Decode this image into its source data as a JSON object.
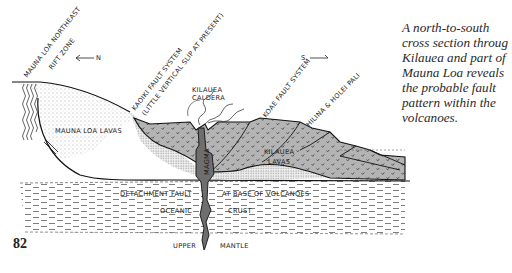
{
  "figure": {
    "labels": {
      "mauna_loa_rift_line1": "MAUNA LOA NORTHEAST",
      "mauna_loa_rift_line2": "RIFT ZONE",
      "north_arrow": "N",
      "south_arrow": "S",
      "kaoiki_line1": "KAOIKI FAULT SYSTEM",
      "kaoiki_line2": "(LITTLE VERTICAL SLIP AT PRESENT)",
      "caldera_line1": "KILAUEA",
      "caldera_line2": "CALDERA",
      "koae": "KOAE FAULT SYSTEM",
      "hilina": "HILINA & HOLEI PALI",
      "mauna_loa_lavas": "MAUNA LOA LAVAS",
      "kilauea_lavas_line1": "KILAUEA",
      "kilauea_lavas_line2": "LAVAS",
      "magma": "MAGMA",
      "detachment_left": "DETACHMENT FAULT",
      "detachment_right": "AT BASE OF VOLCANOES",
      "oceanic": "OCEANIC",
      "crust": "CRUST",
      "upper": "UPPER",
      "mantle": "MANTLE"
    },
    "colors": {
      "kilauea_fill": "#b4b4b4",
      "magma_fill": "#6e6e6e",
      "line": "#1a1a1a"
    }
  },
  "caption": {
    "lines": [
      "A north-to-south",
      "cross section throug",
      "Kilauea and part of",
      "Mauna Loa reveals",
      "the probable fault",
      "pattern within the",
      "volcanoes."
    ]
  },
  "page_number": "82"
}
